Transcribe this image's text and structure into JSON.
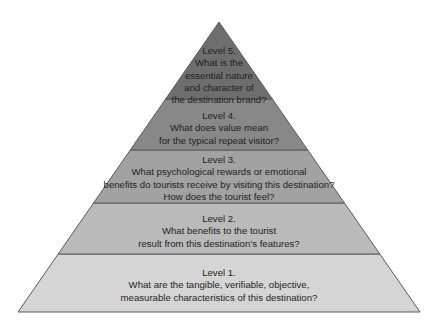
{
  "diagram": {
    "type": "pyramid",
    "apex": [
      219,
      22
    ],
    "base_y": 312,
    "base_left_x": 18,
    "base_right_x": 420,
    "outline_color": "#5a5a5a",
    "levels": [
      {
        "id": "level-1",
        "title": "Level 1.",
        "lines": [
          "What are the tangible, verifiable, objective,",
          "measurable characteristics of this destination?"
        ],
        "y_top": 254,
        "y_bottom": 312,
        "fill": "#d5d5d5",
        "text_top": 267
      },
      {
        "id": "level-2",
        "title": "Level 2.",
        "lines": [
          "What benefits to the tourist",
          "result from this destination’s features?"
        ],
        "y_top": 203,
        "y_bottom": 254,
        "fill": "#bababa",
        "text_top": 213
      },
      {
        "id": "level-3",
        "title": "Level 3.",
        "lines": [
          "What psychological rewards or emotional",
          "benefits do tourists receive by visiting this destination?",
          "How does the tourist feel?"
        ],
        "y_top": 150,
        "y_bottom": 203,
        "fill": "#a2a2a2",
        "text_top": 154
      },
      {
        "id": "level-4",
        "title": "Level 4.",
        "lines": [
          "What does value mean",
          "for the typical repeat visitor?"
        ],
        "y_top": 99,
        "y_bottom": 150,
        "fill": "#888888",
        "text_top": 110
      },
      {
        "id": "level-5",
        "title": "Level 5.",
        "lines": [
          "What is the",
          "essential nature",
          "and character of",
          "the destination brand?"
        ],
        "y_top": 22,
        "y_bottom": 99,
        "fill": "#6e6e6e",
        "text_top": 45
      }
    ]
  }
}
